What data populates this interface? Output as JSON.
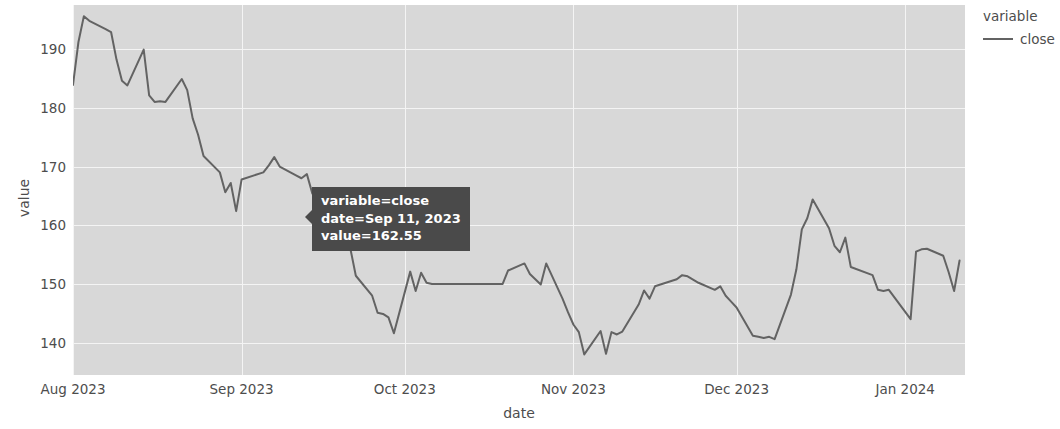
{
  "chart_data": {
    "type": "line",
    "title": "",
    "xlabel": "date",
    "ylabel": "value",
    "grid": true,
    "legend_position": "right",
    "legend_title": "variable",
    "line_color": "#636363",
    "panel_color": "#d8d8d8",
    "gridline_color": "#f4f4f4",
    "xlim": [
      "2023-08-01",
      "2024-01-12"
    ],
    "ylim": [
      134.5,
      197.5
    ],
    "yticks": [
      140,
      150,
      160,
      170,
      180,
      190
    ],
    "ytick_labels": [
      "140",
      "150",
      "160",
      "170",
      "180",
      "190"
    ],
    "xticks": [
      "2023-08-01",
      "2023-09-01",
      "2023-10-01",
      "2023-11-01",
      "2023-12-01",
      "2024-01-01"
    ],
    "xtick_labels": [
      "Aug 2023",
      "Sep 2023",
      "Oct 2023",
      "Nov 2023",
      "Dec 2023",
      "Jan 2024"
    ],
    "series": [
      {
        "name": "close",
        "x": [
          "2023-08-01",
          "2023-08-02",
          "2023-08-03",
          "2023-08-04",
          "2023-08-07",
          "2023-08-08",
          "2023-08-09",
          "2023-08-10",
          "2023-08-11",
          "2023-08-14",
          "2023-08-15",
          "2023-08-16",
          "2023-08-17",
          "2023-08-18",
          "2023-08-21",
          "2023-08-22",
          "2023-08-23",
          "2023-08-24",
          "2023-08-25",
          "2023-08-28",
          "2023-08-29",
          "2023-08-30",
          "2023-08-31",
          "2023-09-01",
          "2023-09-05",
          "2023-09-06",
          "2023-09-07",
          "2023-09-08",
          "2023-09-11",
          "2023-09-12",
          "2023-09-13",
          "2023-09-14",
          "2023-09-15",
          "2023-09-18",
          "2023-09-19",
          "2023-09-20",
          "2023-09-21",
          "2023-09-22",
          "2023-09-25",
          "2023-09-26",
          "2023-09-27",
          "2023-09-28",
          "2023-09-29",
          "2023-10-02",
          "2023-10-03",
          "2023-10-04",
          "2023-10-05",
          "2023-10-06",
          "2023-10-09",
          "2023-10-10",
          "2023-10-11",
          "2023-10-12",
          "2023-10-13",
          "2023-10-16",
          "2023-10-17",
          "2023-10-18",
          "2023-10-19",
          "2023-10-20",
          "2023-10-23",
          "2023-10-24",
          "2023-10-25",
          "2023-10-26",
          "2023-10-27",
          "2023-10-30",
          "2023-10-31",
          "2023-11-01",
          "2023-11-02",
          "2023-11-03",
          "2023-11-06",
          "2023-11-07",
          "2023-11-08",
          "2023-11-09",
          "2023-11-10",
          "2023-11-13",
          "2023-11-14",
          "2023-11-15",
          "2023-11-16",
          "2023-11-17",
          "2023-11-20",
          "2023-11-21",
          "2023-11-22",
          "2023-11-24",
          "2023-11-27",
          "2023-11-28",
          "2023-11-29",
          "2023-11-30",
          "2023-12-01",
          "2023-12-04",
          "2023-12-05",
          "2023-12-06",
          "2023-12-07",
          "2023-12-08",
          "2023-12-11",
          "2023-12-12",
          "2023-12-13",
          "2023-12-14",
          "2023-12-15",
          "2023-12-18",
          "2023-12-19",
          "2023-12-20",
          "2023-12-21",
          "2023-12-22",
          "2023-12-26",
          "2023-12-27",
          "2023-12-28",
          "2023-12-29",
          "2024-01-02",
          "2024-01-03",
          "2024-01-04",
          "2024-01-05",
          "2024-01-08",
          "2024-01-09",
          "2024-01-10",
          "2024-01-11"
        ],
        "y": [
          183.9,
          191.2,
          195.6,
          194.8,
          193.4,
          192.9,
          188.2,
          184.6,
          183.8,
          189.9,
          182.1,
          181.0,
          181.1,
          181.0,
          184.9,
          183.0,
          178.2,
          175.4,
          171.8,
          169.0,
          165.6,
          167.2,
          162.4,
          167.8,
          169.0,
          170.2,
          171.6,
          170.0,
          168.5,
          168.0,
          168.7,
          165.4,
          164.0,
          163.2,
          162.6,
          162.55,
          156.0,
          151.4,
          148.0,
          145.1,
          144.9,
          144.3,
          141.6,
          152.1,
          148.8,
          151.9,
          150.2,
          150.0,
          150.0,
          150.0,
          150.0,
          150.0,
          150.0,
          150.0,
          150.0,
          150.0,
          150.0,
          152.3,
          153.5,
          151.7,
          150.8,
          149.9,
          153.5,
          147.5,
          145.2,
          143.1,
          141.8,
          138.0,
          142.0,
          138.1,
          141.8,
          141.4,
          141.9,
          146.5,
          148.9,
          147.5,
          149.6,
          149.9,
          150.8,
          151.5,
          151.3,
          150.2,
          149.0,
          149.6,
          148.0,
          147.0,
          146.0,
          141.2,
          141.0,
          140.8,
          141.0,
          140.6,
          148.2,
          152.5,
          159.3,
          161.2,
          164.4,
          159.5,
          156.5,
          155.4,
          157.9,
          152.9,
          151.5,
          149.0,
          148.8,
          149.0,
          144.0,
          155.5,
          155.9,
          156.0,
          154.8,
          152.0,
          148.8,
          154.0
        ]
      }
    ],
    "annotation": {
      "lines": [
        "variable=close",
        "date=Sep 11, 2023",
        "value=162.55"
      ],
      "variable": "close",
      "date": "Sep 11, 2023",
      "value": 162.55
    }
  },
  "axes": {
    "xlabel": "date",
    "ylabel": "value",
    "ytick_labels": [
      "190",
      "180",
      "170",
      "160",
      "150",
      "140"
    ],
    "xtick_labels": [
      "Aug 2023",
      "Sep 2023",
      "Oct 2023",
      "Nov 2023",
      "Dec 2023",
      "Jan 2024"
    ]
  },
  "legend": {
    "title": "variable",
    "entries": [
      {
        "label": "close",
        "color": "#636363"
      }
    ]
  },
  "tooltip": {
    "line1": "variable=close",
    "line2": "date=Sep 11, 2023",
    "line3": "value=162.55"
  }
}
